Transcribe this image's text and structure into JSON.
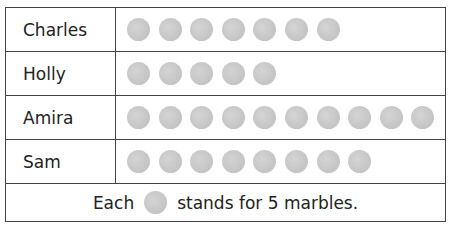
{
  "chart_data": {
    "type": "table",
    "title": "",
    "categories": [
      "Charles",
      "Holly",
      "Amira",
      "Sam"
    ],
    "symbol_counts": [
      7,
      5,
      10,
      8
    ],
    "values": [
      35,
      25,
      50,
      40
    ],
    "key": "Each ● stands for 5 marbles.",
    "units_per_symbol": 5
  },
  "rows": [
    {
      "name": "Charles",
      "count": 7
    },
    {
      "name": "Holly",
      "count": 5
    },
    {
      "name": "Amira",
      "count": 10
    },
    {
      "name": "Sam",
      "count": 8
    }
  ],
  "key": {
    "prefix": "Each",
    "suffix": "stands for 5 marbles."
  },
  "colors": {
    "symbol": "#c6c6c6",
    "border": "#444444"
  }
}
